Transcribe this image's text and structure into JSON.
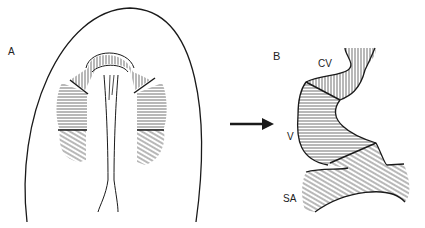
{
  "panels": {
    "a": {
      "label": "A"
    },
    "b": {
      "label": "B",
      "regions": [
        {
          "label": "CV",
          "hatch": "vertical"
        },
        {
          "label": "V",
          "hatch": "horizontal"
        },
        {
          "label": "SA",
          "hatch": "diagonal"
        }
      ]
    }
  },
  "colors": {
    "ink": "#1a1a1a",
    "background": "#ffffff"
  }
}
